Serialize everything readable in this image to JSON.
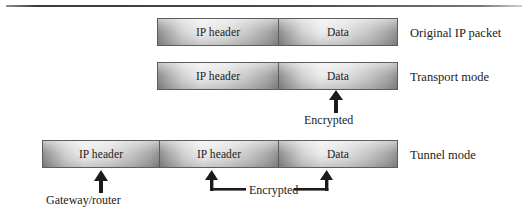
{
  "figure": {
    "rows": [
      {
        "id": "original",
        "caption": "Original IP packet",
        "cells": [
          {
            "label": "IP header"
          },
          {
            "label": "Data"
          }
        ]
      },
      {
        "id": "transport",
        "caption": "Transport mode",
        "cells": [
          {
            "label": "IP header"
          },
          {
            "label": "Data"
          }
        ]
      },
      {
        "id": "tunnel",
        "caption": "Tunnel mode",
        "cells": [
          {
            "label": "IP header"
          },
          {
            "label": "IP header"
          },
          {
            "label": "Data"
          }
        ]
      }
    ],
    "annotations": [
      {
        "id": "transport-encrypted",
        "label": "Encrypted"
      },
      {
        "id": "gateway-router",
        "label": "Gateway/router"
      },
      {
        "id": "tunnel-encrypted",
        "label": "Encrypted"
      }
    ],
    "colors": {
      "bar_light": "#ececec",
      "bar_dark": "#8a8a8a",
      "bar_border": "#5d5d5d",
      "text": "#1b1b1b",
      "background": "#ffffff"
    }
  }
}
